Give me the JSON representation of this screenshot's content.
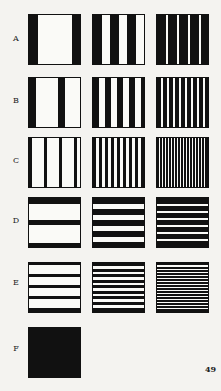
{
  "figure": {
    "columns_x": [
      28,
      92,
      156
    ],
    "rows": [
      {
        "label": "A",
        "label_y": 34,
        "y": 14,
        "orientation": "vertical",
        "patterns": [
          {
            "bars": [
              [
                0,
                9
              ],
              [
                43,
                10
              ]
            ]
          },
          {
            "bars": [
              [
                0,
                9
              ],
              [
                17,
                9
              ],
              [
                34,
                9
              ]
            ]
          },
          {
            "bars": [
              [
                0,
                9
              ],
              [
                11,
                9
              ],
              [
                22,
                9
              ],
              [
                33,
                9
              ],
              [
                44,
                9
              ]
            ]
          }
        ]
      },
      {
        "label": "B",
        "label_y": 96,
        "y": 77,
        "orientation": "vertical",
        "patterns": [
          {
            "bars": [
              [
                0,
                7
              ],
              [
                29,
                7
              ]
            ]
          },
          {
            "bars": [
              [
                0,
                6
              ],
              [
                12,
                6
              ],
              [
                24,
                6
              ],
              [
                36,
                6
              ],
              [
                48,
                5
              ]
            ]
          },
          {
            "bars": [
              [
                0,
                4
              ],
              [
                6,
                4
              ],
              [
                12,
                4
              ],
              [
                18,
                4
              ],
              [
                24,
                4
              ],
              [
                30,
                4
              ],
              [
                36,
                4
              ],
              [
                42,
                4
              ],
              [
                48,
                5
              ]
            ]
          }
        ]
      },
      {
        "label": "C",
        "label_y": 156,
        "y": 137,
        "orientation": "vertical",
        "patterns": [
          {
            "bars": [
              [
                0,
                3
              ],
              [
                15,
                3
              ],
              [
                30,
                3
              ],
              [
                45,
                3
              ]
            ]
          },
          {
            "bars": [
              [
                0,
                3
              ],
              [
                6,
                3
              ],
              [
                12,
                3
              ],
              [
                18,
                3
              ],
              [
                24,
                3
              ],
              [
                30,
                3
              ],
              [
                36,
                3
              ],
              [
                42,
                3
              ],
              [
                48,
                5
              ]
            ]
          },
          {
            "bars": [
              [
                0,
                2
              ],
              [
                3,
                2
              ],
              [
                6,
                2
              ],
              [
                9,
                2
              ],
              [
                12,
                2
              ],
              [
                15,
                2
              ],
              [
                18,
                2
              ],
              [
                21,
                2
              ],
              [
                24,
                2
              ],
              [
                27,
                2
              ],
              [
                30,
                2
              ],
              [
                33,
                2
              ],
              [
                36,
                2
              ],
              [
                39,
                2
              ],
              [
                42,
                2
              ],
              [
                45,
                2
              ],
              [
                48,
                5
              ]
            ]
          }
        ]
      },
      {
        "label": "D",
        "label_y": 216,
        "y": 197,
        "orientation": "horizontal",
        "patterns": [
          {
            "bars": [
              [
                0,
                6
              ],
              [
                22,
                5
              ],
              [
                45,
                6
              ]
            ]
          },
          {
            "bars": [
              [
                0,
                6
              ],
              [
                11,
                6
              ],
              [
                22,
                6
              ],
              [
                33,
                6
              ],
              [
                44,
                7
              ]
            ]
          },
          {
            "bars": [
              [
                0,
                6
              ],
              [
                8,
                5
              ],
              [
                15,
                5
              ],
              [
                22,
                5
              ],
              [
                29,
                5
              ],
              [
                36,
                5
              ],
              [
                43,
                8
              ]
            ]
          }
        ]
      },
      {
        "label": "E",
        "label_y": 278,
        "y": 262,
        "orientation": "horizontal",
        "patterns": [
          {
            "bars": [
              [
                0,
                2
              ],
              [
                11,
                3
              ],
              [
                22,
                3
              ],
              [
                33,
                3
              ],
              [
                45,
                6
              ]
            ]
          },
          {
            "bars": [
              [
                0,
                3
              ],
              [
                6,
                3
              ],
              [
                11,
                3
              ],
              [
                17,
                3
              ],
              [
                22,
                3
              ],
              [
                28,
                3
              ],
              [
                33,
                3
              ],
              [
                39,
                3
              ],
              [
                45,
                6
              ]
            ]
          },
          {
            "bars": [
              [
                0,
                2
              ],
              [
                4,
                2
              ],
              [
                7,
                2
              ],
              [
                10,
                2
              ],
              [
                13,
                2
              ],
              [
                16,
                2
              ],
              [
                19,
                2
              ],
              [
                22,
                2
              ],
              [
                25,
                2
              ],
              [
                28,
                2
              ],
              [
                31,
                2
              ],
              [
                34,
                2
              ],
              [
                37,
                2
              ],
              [
                40,
                2
              ],
              [
                43,
                2
              ],
              [
                46,
                5
              ]
            ]
          }
        ]
      },
      {
        "label": "F",
        "label_y": 344,
        "y": 327,
        "orientation": "solid",
        "patterns": [
          {
            "bars": [
              [
                0,
                51
              ]
            ]
          }
        ]
      }
    ],
    "page_number": "49",
    "colors": {
      "ink": "#111111",
      "paper": "#fafaf7",
      "background": "#f4f3f0"
    }
  }
}
